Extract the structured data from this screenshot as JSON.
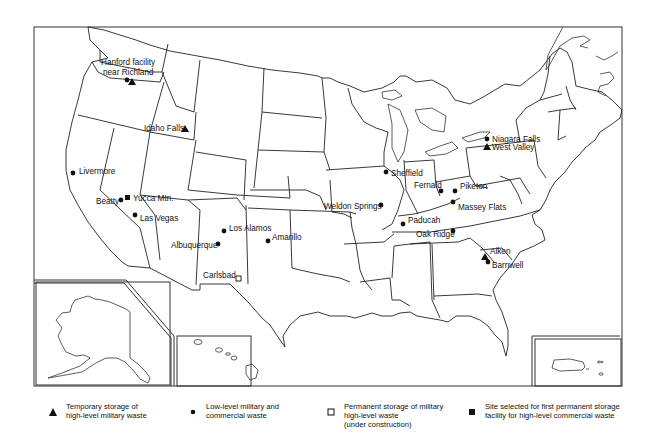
{
  "map": {
    "title": "",
    "colors": {
      "ink": "#111111",
      "background": "#ffffff"
    },
    "insets": [
      {
        "name": "Alaska"
      },
      {
        "name": "Hawaii"
      },
      {
        "name": "Puerto Rico"
      }
    ],
    "sites": [
      {
        "id": "hanford",
        "label_lines": [
          "Hanford facility",
          "near Richland"
        ],
        "types": [
          "low-level",
          "temporary-high-level"
        ]
      },
      {
        "id": "idaho-falls",
        "label_lines": [
          "Idaho Falls"
        ],
        "types": [
          "temporary-high-level"
        ]
      },
      {
        "id": "livermore",
        "label_lines": [
          "Livermore"
        ],
        "types": [
          "low-level"
        ]
      },
      {
        "id": "yucca-mtn",
        "label_lines": [
          "Yucca Mtn."
        ],
        "types": [
          "commercial-permanent-selected"
        ]
      },
      {
        "id": "beatty",
        "label_lines": [
          "Beatty"
        ],
        "types": [
          "low-level"
        ]
      },
      {
        "id": "las-vegas",
        "label_lines": [
          "Las Vegas"
        ],
        "types": [
          "low-level"
        ]
      },
      {
        "id": "los-alamos",
        "label_lines": [
          "Los Alamos"
        ],
        "types": [
          "low-level"
        ]
      },
      {
        "id": "albuquerque",
        "label_lines": [
          "Albuquerque"
        ],
        "types": [
          "low-level"
        ]
      },
      {
        "id": "amarillo",
        "label_lines": [
          "Amarillo"
        ],
        "types": [
          "low-level"
        ]
      },
      {
        "id": "carlsbad",
        "label_lines": [
          "Carlsbad"
        ],
        "types": [
          "military-permanent-under-construction"
        ]
      },
      {
        "id": "sheffield",
        "label_lines": [
          "Sheffield"
        ],
        "types": [
          "low-level"
        ]
      },
      {
        "id": "weldon-springs",
        "label_lines": [
          "Weldon Springs"
        ],
        "types": [
          "low-level"
        ]
      },
      {
        "id": "paducah",
        "label_lines": [
          "Paducah"
        ],
        "types": [
          "low-level"
        ]
      },
      {
        "id": "fernald",
        "label_lines": [
          "Fernald"
        ],
        "types": [
          "low-level"
        ]
      },
      {
        "id": "piketon",
        "label_lines": [
          "Piketon"
        ],
        "types": [
          "low-level"
        ]
      },
      {
        "id": "massey-flats",
        "label_lines": [
          "Massey Flats"
        ],
        "types": [
          "low-level"
        ]
      },
      {
        "id": "oak-ridge",
        "label_lines": [
          "Oak Ridge"
        ],
        "types": [
          "low-level"
        ]
      },
      {
        "id": "niagara-falls",
        "label_lines": [
          "Niagara Falls"
        ],
        "types": [
          "low-level"
        ]
      },
      {
        "id": "west-valley",
        "label_lines": [
          "West Valley"
        ],
        "types": [
          "temporary-high-level"
        ]
      },
      {
        "id": "aiken",
        "label_lines": [
          "Aiken"
        ],
        "types": [
          "temporary-high-level"
        ]
      },
      {
        "id": "barnwell",
        "label_lines": [
          "Barnwell"
        ],
        "types": [
          "low-level"
        ]
      }
    ]
  },
  "legend": {
    "items": [
      {
        "symbol": "triangle",
        "symbol_name": "filled-triangle-icon",
        "lines": [
          "Temporary storage of",
          "high-level military waste"
        ]
      },
      {
        "symbol": "circle",
        "symbol_name": "filled-circle-icon",
        "lines": [
          "Low-level military and",
          "commercial waste"
        ]
      },
      {
        "symbol": "open-square",
        "symbol_name": "open-square-icon",
        "lines": [
          "Permanent storage of military",
          "high-level waste",
          "(under construction)"
        ]
      },
      {
        "symbol": "filled-square",
        "symbol_name": "filled-square-icon",
        "lines": [
          "Site selected for first permanent storage",
          "facility for high-level commercial waste"
        ]
      }
    ]
  }
}
